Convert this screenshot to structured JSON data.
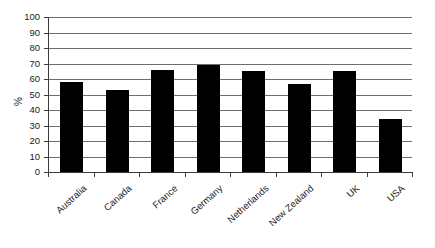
{
  "chart_data": {
    "type": "bar",
    "title": "",
    "subtitle": "",
    "xlabel": "",
    "ylabel": "%",
    "ylim": [
      0,
      100
    ],
    "yticks": [
      0,
      10,
      20,
      30,
      40,
      50,
      60,
      70,
      80,
      90,
      100
    ],
    "grid": true,
    "legend": false,
    "legend_position": "none",
    "bar_color": "#000000",
    "categories": [
      "Australia",
      "Canada",
      "France",
      "Germany",
      "Netherlands",
      "New Zealand",
      "UK",
      "USA"
    ],
    "values": [
      58,
      53,
      66,
      69,
      65,
      57,
      65,
      34
    ]
  }
}
